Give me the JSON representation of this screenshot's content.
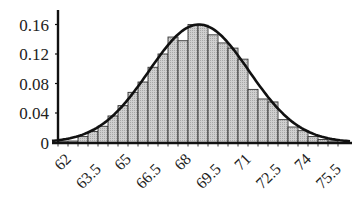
{
  "chart_data": {
    "type": "bar",
    "subtype": "histogram-with-normal-curve",
    "title": "",
    "xlabel": "",
    "ylabel": "",
    "ylim": [
      0,
      0.17
    ],
    "yticks": [
      0,
      0.04,
      0.08,
      0.12,
      0.16
    ],
    "ytick_labels": [
      "0",
      "0.04",
      "0.08",
      "0.12",
      "0.16"
    ],
    "xtick_labels": [
      "62",
      "63.5",
      "65",
      "66.5",
      "68",
      "69.5",
      "71",
      "72.5",
      "74",
      "75.5"
    ],
    "xtick_values": [
      62,
      63.5,
      65,
      66.5,
      68,
      69.5,
      71,
      72.5,
      74,
      75.5
    ],
    "bin_width": 0.5,
    "bin_starts": [
      61.5,
      62.0,
      62.5,
      63.0,
      63.5,
      64.0,
      64.5,
      65.0,
      65.5,
      66.0,
      66.5,
      67.0,
      67.5,
      68.0,
      68.5,
      69.0,
      69.5,
      70.0,
      70.5,
      71.0,
      71.5,
      72.0,
      72.5,
      73.0,
      73.5,
      74.0,
      74.5,
      75.0
    ],
    "values": [
      0.001,
      0.002,
      0.008,
      0.015,
      0.022,
      0.036,
      0.05,
      0.068,
      0.082,
      0.102,
      0.12,
      0.143,
      0.138,
      0.16,
      0.159,
      0.146,
      0.135,
      0.128,
      0.113,
      0.072,
      0.059,
      0.055,
      0.031,
      0.021,
      0.016,
      0.008,
      0.004,
      0.002
    ],
    "curve": {
      "type": "normal-density",
      "mean": 68.8,
      "sd": 2.5,
      "peak": 0.16
    },
    "grid": false,
    "legend": null,
    "colors": {
      "bar_fill": "#c4c4c4",
      "bar_stroke": "#333333",
      "curve": "#111111",
      "axis": "#111111"
    }
  }
}
